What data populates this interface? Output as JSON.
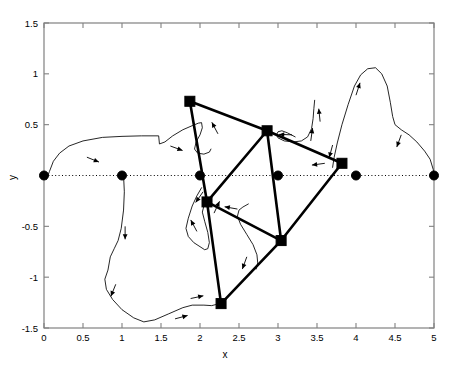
{
  "figure": {
    "title": "",
    "xlabel": "x",
    "ylabel": "y",
    "background": "#ffffff",
    "frame_color": "#808080",
    "line_color": "#000000"
  },
  "chart_data": {
    "type": "scatter",
    "title": "",
    "xlabel": "x",
    "ylabel": "y",
    "xlim": [
      0,
      5
    ],
    "ylim": [
      -1.5,
      1.5
    ],
    "grid": false,
    "legend": null,
    "xticks": [
      0,
      0.5,
      1,
      1.5,
      2,
      2.5,
      3,
      3.5,
      4,
      4.5,
      5
    ],
    "xticklabels": [
      "0",
      "0.5",
      "1",
      "1.5",
      "2",
      "2.5",
      "3",
      "3.5",
      "4",
      "4.5",
      "5"
    ],
    "yticks": [
      -1.5,
      -1,
      -0.5,
      0,
      0.5,
      1,
      1.5
    ],
    "yticklabels": [
      "-1.5",
      "-1",
      "-0.5",
      "",
      "0.5",
      "1",
      "1.5"
    ],
    "series": [
      {
        "name": "reference-nodes",
        "marker": "circle",
        "marker_size": 9,
        "color": "#000000",
        "points": [
          {
            "x": 0,
            "y": 0
          },
          {
            "x": 1,
            "y": 0
          },
          {
            "x": 2,
            "y": 0
          },
          {
            "x": 3,
            "y": 0
          },
          {
            "x": 4,
            "y": 0
          },
          {
            "x": 5,
            "y": 0
          }
        ]
      },
      {
        "name": "mesh-nodes",
        "marker": "square",
        "marker_size": 10,
        "color": "#000000",
        "points": [
          {
            "x": 1.87,
            "y": 0.73
          },
          {
            "x": 2.86,
            "y": 0.44
          },
          {
            "x": 3.82,
            "y": 0.12
          },
          {
            "x": 2.09,
            "y": -0.26
          },
          {
            "x": 3.04,
            "y": -0.64
          },
          {
            "x": 2.27,
            "y": -1.26
          }
        ]
      }
    ],
    "mesh_edges": [
      [
        [
          1.87,
          0.73
        ],
        [
          2.86,
          0.44
        ]
      ],
      [
        [
          2.86,
          0.44
        ],
        [
          3.82,
          0.12
        ]
      ],
      [
        [
          1.87,
          0.73
        ],
        [
          2.09,
          -0.26
        ]
      ],
      [
        [
          2.86,
          0.44
        ],
        [
          2.09,
          -0.26
        ]
      ],
      [
        [
          2.86,
          0.44
        ],
        [
          3.04,
          -0.64
        ]
      ],
      [
        [
          3.82,
          0.12
        ],
        [
          3.04,
          -0.64
        ]
      ],
      [
        [
          2.09,
          -0.26
        ],
        [
          3.04,
          -0.64
        ]
      ],
      [
        [
          2.09,
          -0.26
        ],
        [
          2.27,
          -1.26
        ]
      ],
      [
        [
          2.27,
          -1.26
        ],
        [
          3.04,
          -0.64
        ]
      ]
    ],
    "zero_line": {
      "y": 0,
      "style": "dotted",
      "color": "#000000"
    },
    "trajectories": [
      {
        "name": "outer-upper-left",
        "points": [
          [
            0,
            0.02
          ],
          [
            0.03,
            -0.04
          ],
          [
            0.07,
            0.04
          ],
          [
            0.12,
            0.14
          ],
          [
            0.2,
            0.22
          ],
          [
            0.32,
            0.29
          ],
          [
            0.5,
            0.34
          ],
          [
            0.75,
            0.375
          ],
          [
            1.0,
            0.385
          ],
          [
            1.25,
            0.39
          ],
          [
            1.47,
            0.39
          ],
          [
            1.48,
            0.31
          ],
          [
            1.55,
            0.33
          ],
          [
            1.65,
            0.39
          ],
          [
            1.78,
            0.45
          ],
          [
            1.9,
            0.49
          ],
          [
            1.98,
            0.515
          ],
          [
            2.02,
            0.52
          ],
          [
            2.03,
            0.47
          ],
          [
            2.0,
            0.4
          ],
          [
            1.95,
            0.33
          ],
          [
            1.93,
            0.26
          ],
          [
            1.97,
            0.22
          ],
          [
            2.05,
            0.21
          ],
          [
            2.12,
            0.23
          ],
          [
            2.14,
            0.26
          ]
        ]
      },
      {
        "name": "outer-lower-left",
        "points": [
          [
            1.02,
            0.0
          ],
          [
            1.03,
            -0.16
          ],
          [
            1.02,
            -0.34
          ],
          [
            0.99,
            -0.52
          ],
          [
            0.95,
            -0.64
          ],
          [
            0.9,
            -0.72
          ],
          [
            0.85,
            -0.8
          ],
          [
            0.82,
            -0.93
          ],
          [
            0.78,
            -1.02
          ],
          [
            0.8,
            -1.12
          ],
          [
            0.88,
            -1.22
          ],
          [
            1.0,
            -1.32
          ],
          [
            1.15,
            -1.4
          ],
          [
            1.28,
            -1.44
          ],
          [
            1.42,
            -1.42
          ],
          [
            1.6,
            -1.36
          ],
          [
            1.78,
            -1.3
          ],
          [
            1.9,
            -1.275
          ],
          [
            2.05,
            -1.275
          ],
          [
            2.15,
            -1.28
          ],
          [
            2.2,
            -1.27
          ]
        ]
      },
      {
        "name": "inner-left-loop",
        "points": [
          [
            2.02,
            -0.12
          ],
          [
            1.96,
            -0.2
          ],
          [
            1.9,
            -0.3
          ],
          [
            1.85,
            -0.42
          ],
          [
            1.82,
            -0.52
          ],
          [
            1.85,
            -0.6
          ],
          [
            1.92,
            -0.66
          ],
          [
            2.0,
            -0.7
          ],
          [
            2.06,
            -0.73
          ],
          [
            2.1,
            -0.72
          ],
          [
            2.12,
            -0.66
          ],
          [
            2.1,
            -0.56
          ],
          [
            2.06,
            -0.45
          ],
          [
            2.03,
            -0.36
          ],
          [
            2.05,
            -0.3
          ]
        ]
      },
      {
        "name": "inner-center-curve",
        "points": [
          [
            2.62,
            -0.28
          ],
          [
            2.55,
            -0.31
          ],
          [
            2.5,
            -0.34
          ],
          [
            2.48,
            -0.4
          ],
          [
            2.52,
            -0.48
          ],
          [
            2.6,
            -0.58
          ],
          [
            2.68,
            -0.68
          ],
          [
            2.73,
            -0.78
          ],
          [
            2.74,
            -0.86
          ],
          [
            2.72,
            -0.92
          ]
        ]
      },
      {
        "name": "upper-right-curve",
        "points": [
          [
            3.22,
            0.38
          ],
          [
            3.12,
            0.42
          ],
          [
            3.05,
            0.44
          ],
          [
            3.0,
            0.43
          ],
          [
            2.98,
            0.4
          ],
          [
            3.0,
            0.37
          ],
          [
            3.08,
            0.34
          ],
          [
            3.2,
            0.33
          ],
          [
            3.3,
            0.34
          ],
          [
            3.38,
            0.38
          ],
          [
            3.43,
            0.46
          ],
          [
            3.45,
            0.56
          ],
          [
            3.46,
            0.66
          ],
          [
            3.47,
            0.74
          ]
        ]
      },
      {
        "name": "outer-right-peak",
        "points": [
          [
            3.7,
            0.08
          ],
          [
            3.72,
            0.18
          ],
          [
            3.76,
            0.32
          ],
          [
            3.82,
            0.5
          ],
          [
            3.9,
            0.7
          ],
          [
            3.98,
            0.88
          ],
          [
            4.06,
            0.99
          ],
          [
            4.15,
            1.05
          ],
          [
            4.25,
            1.06
          ],
          [
            4.33,
            1.0
          ],
          [
            4.4,
            0.88
          ],
          [
            4.44,
            0.72
          ],
          [
            4.47,
            0.58
          ],
          [
            4.5,
            0.5
          ],
          [
            4.58,
            0.45
          ],
          [
            4.68,
            0.4
          ],
          [
            4.78,
            0.33
          ],
          [
            4.88,
            0.24
          ],
          [
            4.95,
            0.16
          ],
          [
            4.99,
            0.06
          ],
          [
            5.0,
            0.0
          ]
        ]
      }
    ],
    "arrows": [
      {
        "x": 0.55,
        "y": 0.18,
        "angle": -22
      },
      {
        "x": 1.62,
        "y": 0.29,
        "angle": -20
      },
      {
        "x": 2.23,
        "y": 0.41,
        "angle": 118
      },
      {
        "x": 2.04,
        "y": -0.16,
        "angle": 235
      },
      {
        "x": 1.96,
        "y": -0.55,
        "angle": 118
      },
      {
        "x": 1.04,
        "y": -0.5,
        "angle": 270
      },
      {
        "x": 0.92,
        "y": -1.07,
        "angle": 248
      },
      {
        "x": 1.68,
        "y": -1.41,
        "angle": 15
      },
      {
        "x": 1.88,
        "y": -1.21,
        "angle": 12
      },
      {
        "x": 2.18,
        "y": -0.37,
        "angle": 65
      },
      {
        "x": 2.48,
        "y": -0.33,
        "angle": 170
      },
      {
        "x": 2.6,
        "y": -0.8,
        "angle": 250
      },
      {
        "x": 3.18,
        "y": 0.4,
        "angle": 178
      },
      {
        "x": 3.42,
        "y": 0.34,
        "angle": 82
      },
      {
        "x": 3.54,
        "y": 0.53,
        "angle": 96
      },
      {
        "x": 3.6,
        "y": 0.12,
        "angle": 188
      },
      {
        "x": 3.7,
        "y": 0.3,
        "angle": 255
      },
      {
        "x": 4.0,
        "y": 0.79,
        "angle": 72
      },
      {
        "x": 4.58,
        "y": 0.4,
        "angle": 250
      }
    ]
  }
}
